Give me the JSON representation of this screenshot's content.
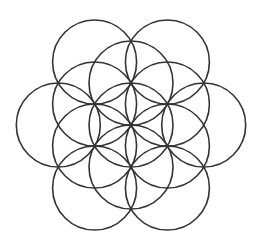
{
  "diagram": {
    "type": "flower-of-life",
    "background": "#ffffff",
    "stroke_color": "#333333",
    "stroke_width": 1.6,
    "center": [
      131,
      125
    ],
    "radius": 42,
    "circles": [
      {
        "cx": 131,
        "cy": 125
      },
      {
        "cx": 131,
        "cy": 83
      },
      {
        "cx": 167.4,
        "cy": 104
      },
      {
        "cx": 167.4,
        "cy": 146
      },
      {
        "cx": 131,
        "cy": 167
      },
      {
        "cx": 94.6,
        "cy": 146
      },
      {
        "cx": 94.6,
        "cy": 104
      },
      {
        "cx": 203.7,
        "cy": 125
      },
      {
        "cx": 167.4,
        "cy": 62
      },
      {
        "cx": 94.6,
        "cy": 62
      },
      {
        "cx": 58.3,
        "cy": 125
      },
      {
        "cx": 94.6,
        "cy": 188
      },
      {
        "cx": 167.4,
        "cy": 188
      }
    ]
  }
}
